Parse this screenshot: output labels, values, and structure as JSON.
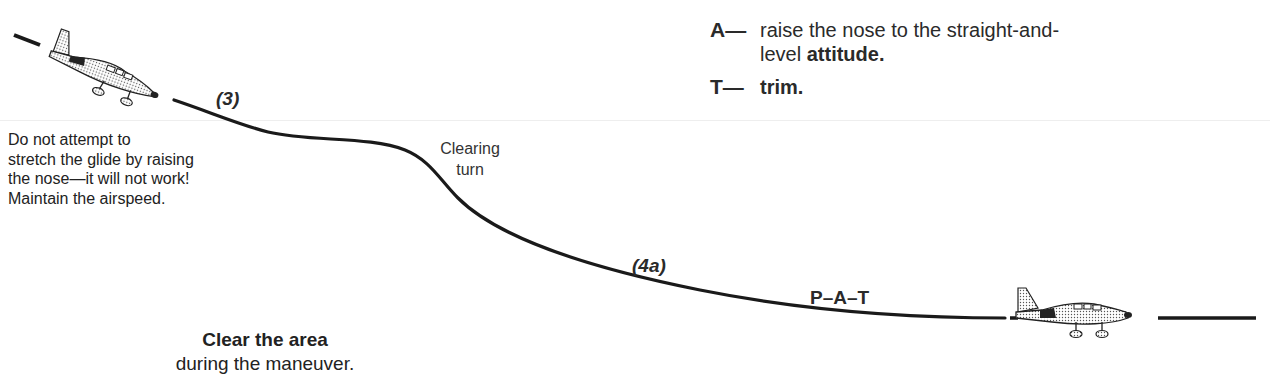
{
  "diagram": {
    "type": "glide-to-level-off maneuver illustration",
    "labels": {
      "step3": "(3)",
      "step4a": "(4a)",
      "clearing_turn": [
        "Clearing",
        "turn"
      ],
      "pat": "P–A–T"
    },
    "note": {
      "lines": [
        "Do not attempt to",
        "stretch the glide by raising",
        "the nose—it will not work!",
        "Maintain the airspeed."
      ]
    },
    "steps": [
      {
        "key": "A—",
        "text": "raise the nose to the straight-and-level ",
        "emphasis": "attitude."
      },
      {
        "key": "T—",
        "text": "",
        "emphasis": "trim."
      }
    ],
    "clear_area": {
      "bold": "Clear the area",
      "normal": "during the maneuver."
    },
    "icons": [
      "airplane-descending-icon",
      "airplane-level-icon"
    ]
  }
}
